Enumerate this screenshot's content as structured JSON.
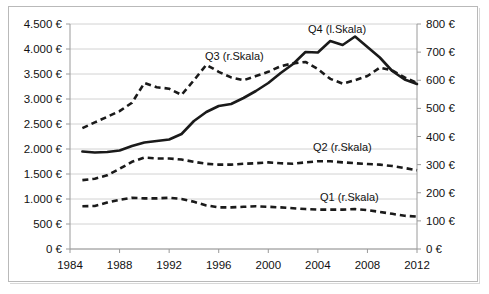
{
  "chart_data": {
    "type": "line",
    "title": "",
    "xlabel": "",
    "ylabel": "",
    "grid": true,
    "legend_position": "inline-annotations",
    "x": [
      1985,
      1986,
      1987,
      1988,
      1989,
      1990,
      1991,
      1992,
      1993,
      1994,
      1995,
      1996,
      1997,
      1998,
      1999,
      2000,
      2001,
      2002,
      2003,
      2004,
      2005,
      2006,
      2007,
      2008,
      2009,
      2010,
      2011,
      2012
    ],
    "x_tick_labels": [
      "1984",
      "1988",
      "1992",
      "1996",
      "2000",
      "2004",
      "2008",
      "2012"
    ],
    "x_ticks": [
      1984,
      1988,
      1992,
      1996,
      2000,
      2004,
      2008,
      2012
    ],
    "xlim": [
      1984,
      2012
    ],
    "left_axis": {
      "label": "",
      "ylim": [
        0,
        4500
      ],
      "tick_step": 500,
      "tick_labels": [
        "0 €",
        "500 €",
        "1.000 €",
        "1.500 €",
        "2.000 €",
        "2.500 €",
        "3.000 €",
        "3.500 €",
        "4.000 €",
        "4.500 €"
      ],
      "tick_values": [
        0,
        500,
        1000,
        1500,
        2000,
        2500,
        3000,
        3500,
        4000,
        4500
      ]
    },
    "right_axis": {
      "label": "",
      "ylim": [
        0,
        800
      ],
      "tick_step": 100,
      "tick_labels": [
        "0 €",
        "100 €",
        "200 €",
        "300 €",
        "400 €",
        "500 €",
        "600 €",
        "700 €",
        "800 €"
      ],
      "tick_values": [
        0,
        100,
        200,
        300,
        400,
        500,
        600,
        700,
        800
      ]
    },
    "series": [
      {
        "name": "Q4 (l.Skala)",
        "axis": "left",
        "style": "solid",
        "annotation": "Q4 (l.Skala)",
        "values": [
          1950,
          1930,
          1940,
          1970,
          2060,
          2130,
          2160,
          2190,
          2300,
          2560,
          2740,
          2860,
          2900,
          3020,
          3160,
          3320,
          3520,
          3700,
          3940,
          3930,
          4160,
          4080,
          4250,
          4040,
          3830,
          3560,
          3390,
          3300
        ]
      },
      {
        "name": "Q3 (r.Skala)",
        "axis": "right",
        "style": "dashed",
        "annotation": "Q3 (r.Skala)",
        "values": [
          430,
          450,
          470,
          490,
          520,
          590,
          575,
          570,
          548,
          600,
          655,
          630,
          610,
          600,
          615,
          630,
          650,
          660,
          665,
          640,
          605,
          588,
          600,
          615,
          645,
          635,
          610,
          590
        ]
      },
      {
        "name": "Q2 (r.Skala)",
        "axis": "right",
        "style": "dashed",
        "annotation": "Q2 (r.Skala)",
        "values": [
          245,
          250,
          262,
          285,
          310,
          325,
          322,
          322,
          318,
          310,
          303,
          300,
          300,
          303,
          305,
          308,
          305,
          303,
          308,
          312,
          312,
          308,
          305,
          302,
          300,
          295,
          288,
          280
        ]
      },
      {
        "name": "Q1 (r.Skala)",
        "axis": "right",
        "style": "dashed",
        "annotation": "Q1 (r.Skala)",
        "values": [
          152,
          153,
          165,
          175,
          182,
          180,
          180,
          182,
          178,
          168,
          155,
          148,
          148,
          150,
          152,
          150,
          148,
          145,
          142,
          140,
          140,
          140,
          142,
          138,
          132,
          125,
          118,
          115
        ]
      }
    ]
  },
  "annotations": {
    "q4": "Q4 (l.Skala)",
    "q3": "Q3 (r.Skala)",
    "q2": "Q2 (r.Skala)",
    "q1": "Q1 (r.Skala)"
  },
  "colors": {
    "series": "#1a1a1a",
    "gridline": "#c6c6c6",
    "axis": "#9a9a9a",
    "text": "#111111",
    "background": "#ffffff",
    "frame": "#b9b9b9"
  }
}
